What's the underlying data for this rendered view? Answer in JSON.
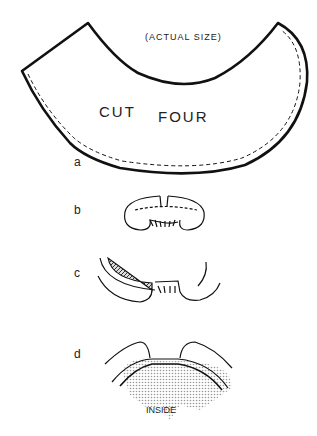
{
  "figure": {
    "pattern": {
      "note": "(ACTUAL SIZE)",
      "instruction_word1": "CUT",
      "instruction_word2": "FOUR"
    },
    "steps": [
      {
        "label": "a"
      },
      {
        "label": "b"
      },
      {
        "label": "c"
      },
      {
        "label": "d",
        "annotation": "INSIDE"
      }
    ]
  }
}
